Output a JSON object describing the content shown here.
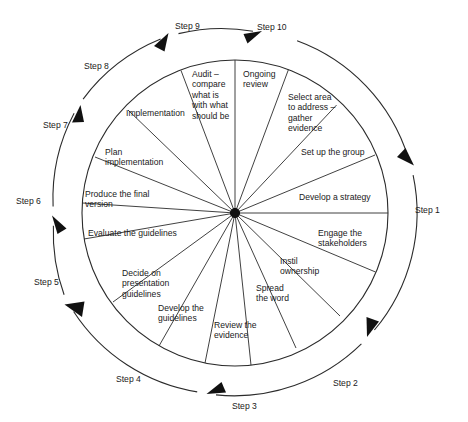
{
  "diagram": {
    "type": "circular-cycle-wheel",
    "center": {
      "x": 235,
      "y": 213
    },
    "pie_radius": 153,
    "outer_ring_radius": 182,
    "flow_direction": "clockwise",
    "colors": {
      "line": "#2b2b2b",
      "text": "#1a1a1a",
      "background": "#ffffff",
      "hub": "#111111"
    },
    "segments": [
      {
        "id": "ongoing-review",
        "label": "Ongoing\nreview",
        "x": 243,
        "y": 69,
        "align": "left"
      },
      {
        "id": "select-area",
        "label": "Select area\nto address –\ngather\nevidence",
        "x": 288,
        "y": 92,
        "align": "left"
      },
      {
        "id": "set-up-the-group",
        "label": "Set up the group",
        "x": 301,
        "y": 147,
        "align": "left"
      },
      {
        "id": "develop-a-strategy",
        "label": "Develop a strategy",
        "x": 299,
        "y": 192,
        "align": "left"
      },
      {
        "id": "engage-stakeholders",
        "label": "Engage the\nstakeholders",
        "x": 318,
        "y": 228,
        "align": "left"
      },
      {
        "id": "instil-ownership",
        "label": "Instil\nownership",
        "x": 280,
        "y": 256,
        "align": "left"
      },
      {
        "id": "spread-the-word",
        "label": "Spread\nthe word",
        "x": 256,
        "y": 283,
        "align": "left"
      },
      {
        "id": "review-the-evidence",
        "label": "Review the\nevidence",
        "x": 214,
        "y": 320,
        "align": "left"
      },
      {
        "id": "develop-the-guidelines",
        "label": "Develop the\nguidelines",
        "x": 158,
        "y": 303,
        "align": "left"
      },
      {
        "id": "decide-presentation",
        "label": "Decide on\npresentation\nguidelines",
        "x": 122,
        "y": 268,
        "align": "left"
      },
      {
        "id": "evaluate-guidelines",
        "label": "Evaluate the guidelines",
        "x": 88,
        "y": 228,
        "align": "left"
      },
      {
        "id": "produce-final-version",
        "label": "Produce the final\nversion",
        "x": 85,
        "y": 189,
        "align": "left"
      },
      {
        "id": "plan-implementation",
        "label": "Plan\nimplementation",
        "x": 105,
        "y": 147,
        "align": "left"
      },
      {
        "id": "implementation",
        "label": "Implementation",
        "x": 126,
        "y": 108,
        "align": "left"
      },
      {
        "id": "audit-compare",
        "label": "Audit –\ncompare\nwhat is\nwith what\nshould be",
        "x": 192,
        "y": 69,
        "align": "left"
      }
    ],
    "steps": [
      {
        "id": "step-1",
        "label": "Step 1",
        "x": 415,
        "y": 205
      },
      {
        "id": "step-2",
        "label": "Step 2",
        "x": 333,
        "y": 378
      },
      {
        "id": "step-3",
        "label": "Step 3",
        "x": 232,
        "y": 401
      },
      {
        "id": "step-4",
        "label": "Step 4",
        "x": 116,
        "y": 374
      },
      {
        "id": "step-5",
        "label": "Step 5",
        "x": 34,
        "y": 277
      },
      {
        "id": "step-6",
        "label": "Step 6",
        "x": 16,
        "y": 196
      },
      {
        "id": "step-7",
        "label": "Step 7",
        "x": 43,
        "y": 120
      },
      {
        "id": "step-8",
        "label": "Step 8",
        "x": 84,
        "y": 61
      },
      {
        "id": "step-9",
        "label": "Step 9",
        "x": 175,
        "y": 21
      },
      {
        "id": "step-10",
        "label": "Step 10",
        "x": 257,
        "y": 22
      }
    ]
  }
}
